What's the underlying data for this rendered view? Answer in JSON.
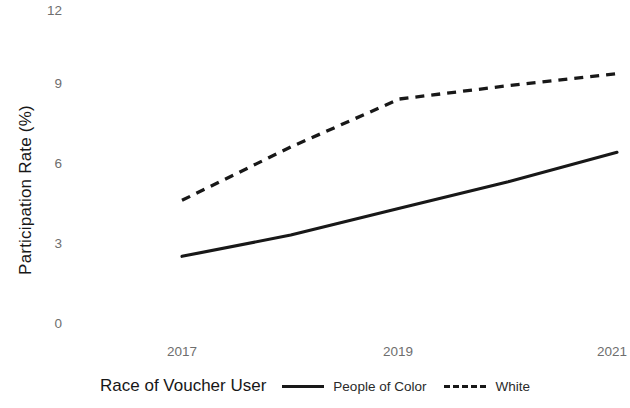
{
  "chart_data": {
    "type": "line",
    "title": "",
    "xlabel": "",
    "ylabel": "Participation Rate (%)",
    "x": [
      2017,
      2018,
      2019,
      2020,
      2021
    ],
    "xlim": [
      2016.6,
      2021.3
    ],
    "ylim": [
      0,
      12
    ],
    "xticks": [
      "2017",
      "2019",
      "2021"
    ],
    "yticks": [
      "0",
      "3",
      "6",
      "9",
      "12"
    ],
    "grid": false,
    "legend_position": "bottom",
    "legend_title": "Race of Voucher User",
    "series": [
      {
        "name": "People of Color",
        "style": "solid",
        "color": "#181818",
        "values": [
          2.5,
          3.3,
          4.3,
          5.3,
          6.4
        ]
      },
      {
        "name": "White",
        "style": "dashed",
        "color": "#181818",
        "values": [
          4.6,
          6.6,
          8.4,
          8.9,
          9.35
        ]
      }
    ]
  },
  "axes": {
    "y_axis_label": "Participation Rate (%)",
    "y_ticks": [
      {
        "label": "12",
        "value": 12
      },
      {
        "label": "9",
        "value": 9
      },
      {
        "label": "6",
        "value": 6
      },
      {
        "label": "3",
        "value": 3
      },
      {
        "label": "0",
        "value": 0
      }
    ],
    "x_ticks": [
      {
        "label": "2017",
        "value": 2017
      },
      {
        "label": "2019",
        "value": 2019
      },
      {
        "label": "2021",
        "value": 2021
      }
    ]
  },
  "legend": {
    "title": "Race of Voucher User",
    "entries": [
      {
        "label": "People of Color",
        "style": "solid"
      },
      {
        "label": "White",
        "style": "dashed"
      }
    ]
  }
}
